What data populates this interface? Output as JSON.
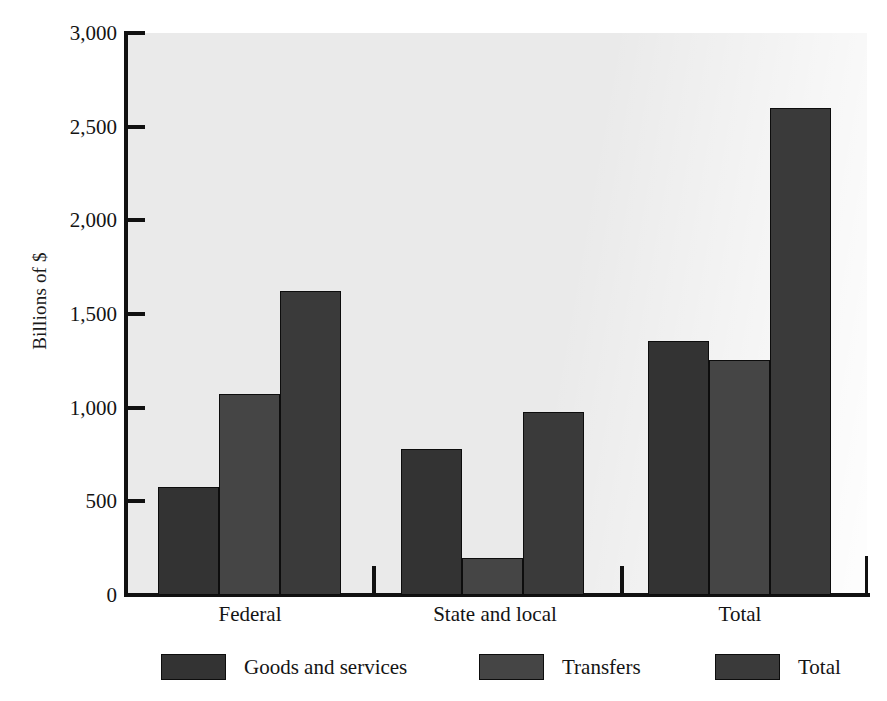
{
  "chart_data": {
    "type": "bar",
    "title": "",
    "subtitle": "",
    "xlabel": "",
    "ylabel": "Billions of $",
    "categories": [
      "Federal",
      "State and local",
      "Total"
    ],
    "series": [
      {
        "name": "Goods and services",
        "color": "#333333",
        "values": [
          575,
          780,
          1355
        ]
      },
      {
        "name": "Transfers",
        "color": "#454545",
        "values": [
          1075,
          195,
          1255
        ]
      },
      {
        "name": "Total",
        "color": "#3a3a3a",
        "values": [
          1625,
          975,
          2600
        ]
      }
    ],
    "ylim": [
      0,
      3000
    ],
    "ytick_values": [
      0,
      500,
      1000,
      1500,
      2000,
      2500,
      3000
    ],
    "ytick_labels": [
      "0",
      "500",
      "1,000",
      "1,500",
      "2,000",
      "2,500",
      "3,000"
    ],
    "grid": false,
    "legend_position": "bottom",
    "plot_background": "#eaeaea",
    "axis_color": "#111111"
  }
}
